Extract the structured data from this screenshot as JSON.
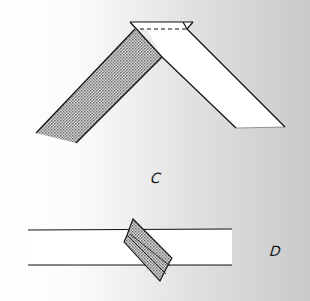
{
  "figure": {
    "diagrams": [
      {
        "id": "C",
        "label": "C",
        "description": "Strip folded at an angle with folded-over tab at top; one half shaded (reverse side), one half white"
      },
      {
        "id": "D",
        "label": "D",
        "description": "Horizontal white strip with a small shaded folded piece placed diagonally across it"
      }
    ],
    "colors": {
      "line": "#111111",
      "paper_front": "#ffffff",
      "paper_back_pattern": "#888888",
      "background_left": "#ffffff",
      "background_right": "#c9c9c9"
    }
  }
}
